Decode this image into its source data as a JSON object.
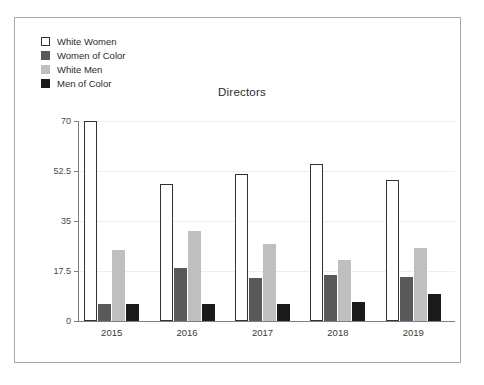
{
  "figure": {
    "title": "Directors",
    "border_color": "#a8a8a8",
    "background": "#ffffff"
  },
  "legend": {
    "position": "top-left",
    "items": [
      {
        "label": "White Women",
        "color": "#ffffff",
        "border": "#333333",
        "swatch_icon": "square-outline-swatch"
      },
      {
        "label": "Women of Color",
        "color": "#595959",
        "border": "#595959",
        "swatch_icon": "square-filled-swatch"
      },
      {
        "label": "White Men",
        "color": "#bfbfbf",
        "border": "#bfbfbf",
        "swatch_icon": "square-filled-swatch"
      },
      {
        "label": "Men of Color",
        "color": "#1a1a1a",
        "border": "#1a1a1a",
        "swatch_icon": "square-filled-swatch"
      }
    ]
  },
  "axes": {
    "y_ticks": [
      "0",
      "17.5",
      "35",
      "52.5",
      "70"
    ],
    "x_ticks": [
      "2015",
      "2016",
      "2017",
      "2018",
      "2019"
    ]
  },
  "chart_data": {
    "type": "bar",
    "title": "Directors",
    "xlabel": "",
    "ylabel": "",
    "ylim": [
      0,
      70
    ],
    "yticks": [
      0,
      17.5,
      35,
      52.5,
      70
    ],
    "grid": true,
    "legend_position": "top-left",
    "categories": [
      "2015",
      "2016",
      "2017",
      "2018",
      "2019"
    ],
    "series": [
      {
        "name": "White Women",
        "color": "#ffffff",
        "values": [
          70,
          48,
          51.5,
          55,
          49.5
        ]
      },
      {
        "name": "Women of Color",
        "color": "#595959",
        "values": [
          6,
          18.5,
          15,
          16,
          15.5
        ]
      },
      {
        "name": "White Men",
        "color": "#bfbfbf",
        "values": [
          25,
          31.5,
          27,
          21.5,
          25.5
        ]
      },
      {
        "name": "Men of Color",
        "color": "#1a1a1a",
        "values": [
          6,
          6,
          6,
          6.5,
          9.5
        ]
      }
    ]
  }
}
